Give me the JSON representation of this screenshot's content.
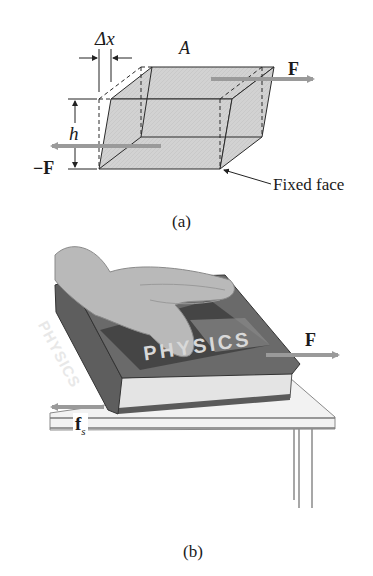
{
  "figure": {
    "panel_a": {
      "caption": "(a)",
      "labels": {
        "delta_x": "Δx",
        "area": "A",
        "force": "F",
        "neg_force": "−F",
        "height": "h",
        "fixed_face": "Fixed face"
      }
    },
    "panel_b": {
      "caption": "(b)",
      "labels": {
        "force": "F",
        "friction": "f",
        "friction_subscript": "s",
        "book_spine_text": "PHYSICS",
        "book_cover_text": "PHYSICS"
      }
    },
    "colors": {
      "block_fill": "#cfcfcf",
      "arrow": "#9a9a9a",
      "line": "#2a2a2a",
      "book_dark": "#3a3a3a",
      "book_cover": "#6e6e6e",
      "pages": "#e6e6e6",
      "table": "#f2f2f2"
    }
  }
}
